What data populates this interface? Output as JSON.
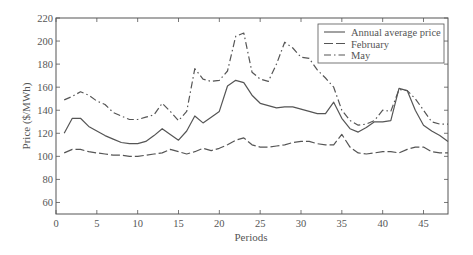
{
  "chart_data": {
    "type": "line",
    "title": "",
    "xlabel": "Periods",
    "ylabel": "Price ($/MWh)",
    "xlim": [
      0,
      48
    ],
    "ylim": [
      50,
      220
    ],
    "xticks": [
      0,
      5,
      10,
      15,
      20,
      25,
      30,
      35,
      40,
      45
    ],
    "yticks": [
      60,
      80,
      100,
      120,
      140,
      160,
      180,
      200,
      220
    ],
    "grid": false,
    "legend_position": "upper right",
    "x": [
      1,
      2,
      3,
      4,
      5,
      6,
      7,
      8,
      9,
      10,
      11,
      12,
      13,
      14,
      15,
      16,
      17,
      18,
      19,
      20,
      21,
      22,
      23,
      24,
      25,
      26,
      27,
      28,
      29,
      30,
      31,
      32,
      33,
      34,
      35,
      36,
      37,
      38,
      39,
      40,
      41,
      42,
      43,
      44,
      45,
      46,
      47,
      48
    ],
    "series": [
      {
        "name": "Annual average price",
        "style": "solid",
        "values": [
          120,
          133,
          133,
          126,
          122,
          118,
          115,
          112,
          111,
          111,
          113,
          118,
          124,
          119,
          114,
          122,
          135,
          129,
          134,
          139,
          161,
          166,
          164,
          153,
          146,
          144,
          142,
          143,
          143,
          141,
          139,
          137,
          137,
          147,
          133,
          124,
          121,
          125,
          130,
          130,
          131,
          159,
          157,
          140,
          127,
          122,
          118,
          113
        ]
      },
      {
        "name": "February",
        "style": "dashed",
        "values": [
          103,
          106,
          106,
          104,
          103,
          102,
          101,
          101,
          100,
          100,
          101,
          102,
          103,
          106,
          104,
          102,
          104,
          107,
          105,
          107,
          110,
          114,
          116,
          110,
          108,
          108,
          109,
          110,
          112,
          113,
          113,
          111,
          110,
          110,
          119,
          108,
          103,
          102,
          103,
          104,
          104,
          103,
          106,
          108,
          108,
          104,
          103,
          103
        ]
      },
      {
        "name": "May",
        "style": "dashdot",
        "values": [
          149,
          152,
          156,
          153,
          148,
          145,
          138,
          135,
          132,
          132,
          134,
          136,
          146,
          139,
          131,
          139,
          176,
          167,
          165,
          166,
          174,
          204,
          207,
          173,
          167,
          165,
          180,
          199,
          194,
          186,
          185,
          175,
          168,
          160,
          140,
          131,
          127,
          128,
          131,
          140,
          139,
          158,
          157,
          150,
          140,
          130,
          128,
          128
        ]
      }
    ]
  },
  "legend": {
    "items": [
      {
        "label": "Annual average price"
      },
      {
        "label": "February"
      },
      {
        "label": "May"
      }
    ]
  },
  "colors": {
    "line": "#555555",
    "axis": "#555555"
  }
}
